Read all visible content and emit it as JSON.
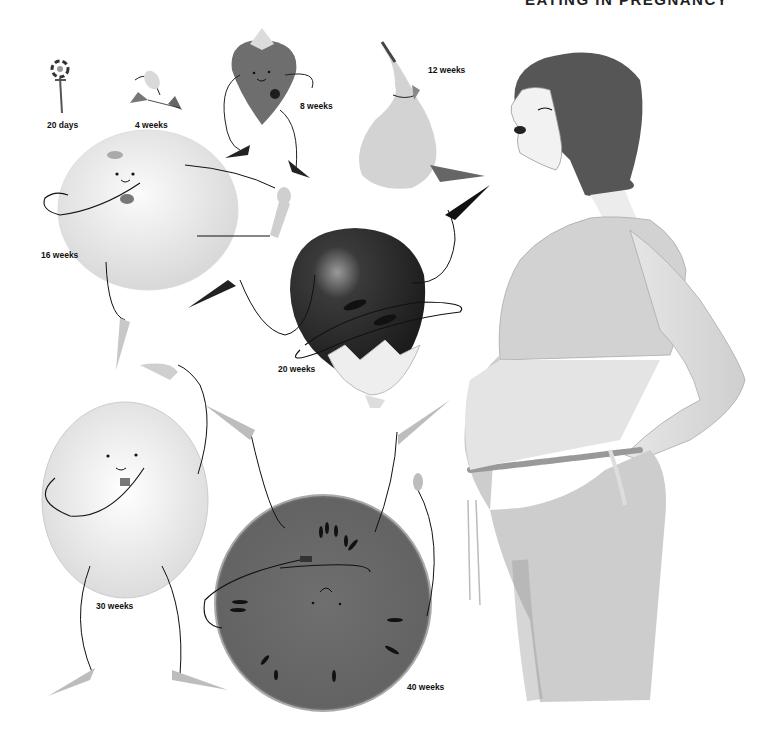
{
  "header": {
    "title": "EATING IN PREGNANCY"
  },
  "stages": [
    {
      "label": "20 days",
      "fruit": "poppy-seed",
      "tone": "#555555"
    },
    {
      "label": "4 weeks",
      "fruit": "apple-seed",
      "tone": "#aaaaaa"
    },
    {
      "label": "8 weeks",
      "fruit": "strawberry",
      "tone": "#6e6e6e"
    },
    {
      "label": "12 weeks",
      "fruit": "pear",
      "tone": "#c8c8c8"
    },
    {
      "label": "16 weeks",
      "fruit": "orange",
      "tone": "#eeeeee"
    },
    {
      "label": "20 weeks",
      "fruit": "aubergine",
      "tone": "#2e2e2e"
    },
    {
      "label": "30 weeks",
      "fruit": "grapefruit",
      "tone": "#e6e6e6"
    },
    {
      "label": "40 weeks",
      "fruit": "watermelon",
      "tone": "#6a6a6a"
    }
  ]
}
